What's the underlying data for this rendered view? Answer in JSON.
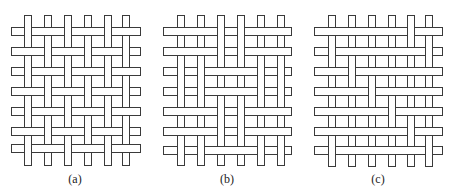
{
  "figure": {
    "colors": {
      "stroke": "#3a3a3a",
      "fill": "#ffffff",
      "background": "#ffffff"
    },
    "thread": {
      "warp_width": 7,
      "weft_height": 8,
      "pitch": 20
    },
    "panels": [
      {
        "id": "a",
        "caption": "(a)",
        "caption_x": 75,
        "warp_x": [
          24,
          44,
          64,
          84,
          104,
          122
        ],
        "weft_y": [
          27,
          47,
          67,
          87,
          107,
          127,
          144
        ],
        "warp_top": 15,
        "warp_bottom": 165,
        "weft_left": 11,
        "weft_right": 140,
        "over": [
          [
            1,
            0,
            1,
            0,
            1,
            0
          ],
          [
            0,
            1,
            0,
            1,
            0,
            1
          ],
          [
            1,
            0,
            1,
            0,
            1,
            0
          ],
          [
            0,
            1,
            0,
            1,
            0,
            1
          ],
          [
            1,
            0,
            1,
            0,
            1,
            0
          ],
          [
            0,
            1,
            0,
            1,
            0,
            1
          ],
          [
            1,
            0,
            1,
            0,
            1,
            0
          ]
        ]
      },
      {
        "id": "b",
        "caption": "(b)",
        "caption_x": 227,
        "warp_x": [
          177,
          197,
          217,
          237,
          257,
          277
        ],
        "weft_y": [
          27,
          47,
          67,
          87,
          107,
          127,
          146
        ],
        "warp_top": 15,
        "warp_bottom": 165,
        "weft_left": 163,
        "weft_right": 291,
        "over": [
          [
            0,
            0,
            1,
            1,
            0,
            0
          ],
          [
            0,
            0,
            1,
            1,
            0,
            0
          ],
          [
            1,
            1,
            0,
            0,
            1,
            1
          ],
          [
            1,
            1,
            0,
            0,
            1,
            1
          ],
          [
            0,
            0,
            1,
            1,
            0,
            0
          ],
          [
            0,
            0,
            1,
            1,
            0,
            0
          ],
          [
            1,
            1,
            0,
            0,
            1,
            1
          ]
        ]
      },
      {
        "id": "c",
        "caption": "(c)",
        "caption_x": 378,
        "warp_x": [
          328,
          348,
          368,
          388,
          407,
          425
        ],
        "weft_y": [
          27,
          47,
          67,
          87,
          107,
          127,
          146
        ],
        "warp_top": 15,
        "warp_bottom": 166,
        "weft_left": 314,
        "weft_right": 442,
        "over": [
          [
            0,
            0,
            0,
            0,
            1,
            0
          ],
          [
            1,
            0,
            0,
            0,
            0,
            1
          ],
          [
            0,
            1,
            0,
            0,
            0,
            0
          ],
          [
            0,
            0,
            1,
            0,
            0,
            0
          ],
          [
            0,
            0,
            0,
            1,
            0,
            0
          ],
          [
            0,
            0,
            0,
            0,
            1,
            0
          ],
          [
            1,
            0,
            0,
            0,
            0,
            1
          ]
        ]
      }
    ]
  }
}
